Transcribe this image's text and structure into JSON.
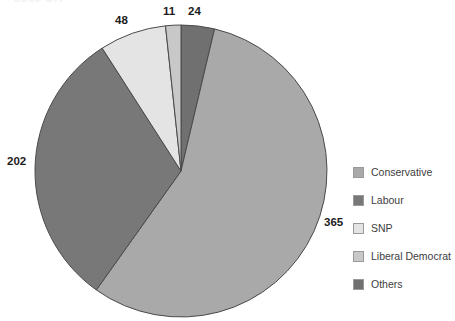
{
  "clipped_title": "2019 UK",
  "chart_data": {
    "type": "pie",
    "title": "",
    "xlabel": "",
    "ylabel": "",
    "legend_position": "right",
    "grid": false,
    "total": 650,
    "categories": [
      "Conservative",
      "Labour",
      "SNP",
      "Liberal Democrat",
      "Others"
    ],
    "values": [
      365,
      202,
      48,
      11,
      24
    ],
    "colors": [
      "#a9a9a9",
      "#787878",
      "#e4e4e4",
      "#c8c8c8",
      "#707070"
    ],
    "slice_order_clockwise_from_top": [
      "Others",
      "Conservative",
      "Labour",
      "SNP",
      "Liberal Democrat"
    ],
    "data_labels": [
      "365",
      "202",
      "48",
      "11",
      "24"
    ]
  },
  "labels": {
    "conservative": "365",
    "labour": "202",
    "snp": "48",
    "libdem": "11",
    "others": "24"
  },
  "legend": {
    "items": [
      {
        "label": "Conservative",
        "color": "#a9a9a9"
      },
      {
        "label": "Labour",
        "color": "#787878"
      },
      {
        "label": "SNP",
        "color": "#e4e4e4"
      },
      {
        "label": "Liberal Democrat",
        "color": "#c8c8c8"
      },
      {
        "label": "Others",
        "color": "#707070"
      }
    ]
  }
}
